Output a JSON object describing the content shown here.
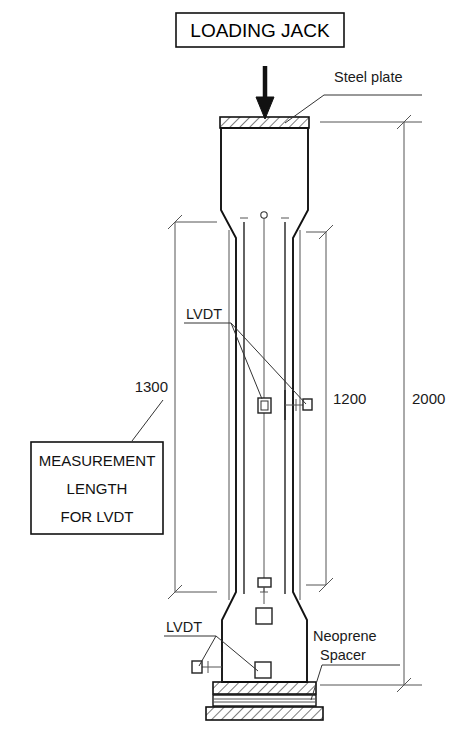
{
  "figure": {
    "type": "engineering-drawing"
  },
  "title_box": {
    "label": "LOADING JACK"
  },
  "callouts": {
    "steel_plate": "Steel plate",
    "lvdt_upper": "LVDT",
    "lvdt_lower": "LVDT",
    "neoprene_line1": "Neoprene",
    "neoprene_line2": "Spacer"
  },
  "note_box": {
    "line1": "MEASUREMENT",
    "line2": "LENGTH",
    "line3": "FOR LVDT"
  },
  "dimensions": [
    {
      "name": "measurement-length",
      "value": "1300",
      "x": 175,
      "y": 392
    },
    {
      "name": "lvdt-gauge-length",
      "value": "1200",
      "x": 333,
      "y": 404
    },
    {
      "name": "overall-height",
      "value": "2000",
      "x": 412,
      "y": 404
    }
  ],
  "colors": {
    "ink": "#111111",
    "thin_line": "#555555",
    "paper": "#ffffff"
  }
}
